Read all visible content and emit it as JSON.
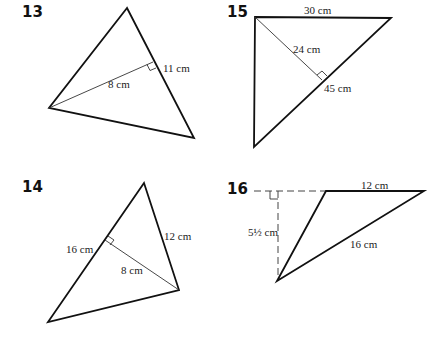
{
  "figures": [
    {
      "number": "13",
      "labels": {
        "side": "11 cm",
        "height": "8 cm"
      }
    },
    {
      "number": "15",
      "labels": {
        "top": "30 cm",
        "height": "24 cm",
        "base": "45 cm"
      }
    },
    {
      "number": "14",
      "labels": {
        "right": "12 cm",
        "base": "16 cm",
        "height": "8 cm"
      }
    },
    {
      "number": "16",
      "labels": {
        "top": "12 cm",
        "slant": "16 cm",
        "height": "5½ cm"
      }
    }
  ],
  "colors": {
    "stroke": "#111111",
    "thin": "#333333",
    "background": "#ffffff"
  }
}
